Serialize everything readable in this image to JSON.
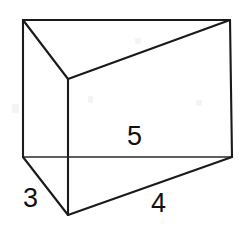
{
  "figure": {
    "name": "triangular-prism",
    "background_color": "#ffffff",
    "stroke_color": "#1a1a1a",
    "label_color": "#111111",
    "canvas": {
      "width": 247,
      "height": 229
    }
  },
  "labels": {
    "top_edge": "5",
    "left_edge": "3",
    "bottom_edge": "4"
  },
  "geometry": {
    "vertices": {
      "top_back_left": {
        "x": 23,
        "y": 20
      },
      "top_back_right": {
        "x": 230,
        "y": 20
      },
      "top_front": {
        "x": 68,
        "y": 79
      },
      "bottom_back_left": {
        "x": 23,
        "y": 157
      },
      "bottom_back_right": {
        "x": 232,
        "y": 157
      },
      "bottom_front": {
        "x": 68,
        "y": 215
      }
    },
    "edges": [
      {
        "name": "top-back-edge",
        "from": "top_back_left",
        "to": "top_back_right"
      },
      {
        "name": "top-left-edge",
        "from": "top_back_left",
        "to": "top_front"
      },
      {
        "name": "top-right-edge",
        "from": "top_front",
        "to": "top_back_right"
      },
      {
        "name": "left-vertical-edge",
        "from": "top_back_left",
        "to": "bottom_back_left"
      },
      {
        "name": "front-vertical-edge",
        "from": "top_front",
        "to": "bottom_front"
      },
      {
        "name": "right-vertical-edge",
        "from": "top_back_right",
        "to": "bottom_back_right"
      },
      {
        "name": "bottom-back-edge",
        "from": "bottom_back_left",
        "to": "bottom_back_right"
      },
      {
        "name": "bottom-left-edge",
        "from": "bottom_back_left",
        "to": "bottom_front"
      },
      {
        "name": "bottom-right-edge",
        "from": "bottom_front",
        "to": "bottom_back_right"
      }
    ]
  }
}
